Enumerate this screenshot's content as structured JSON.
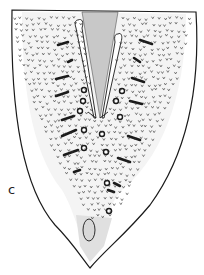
{
  "figure": {
    "panel_label": "c",
    "ink_color": "#1a1a1a",
    "paper_color": "#ffffff"
  }
}
